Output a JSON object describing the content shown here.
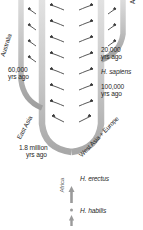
{
  "diagram": {
    "type": "evolution-migration-tree",
    "colors": {
      "trunk_dark": "#9a9a9a",
      "branch_light": "#d9d9d9",
      "branch_mid": "#b5b5b5",
      "arrow": "#3a3a3a",
      "text": "#1f1f1f",
      "background": "#ffffff"
    },
    "regions": {
      "america": "America",
      "australia": "Australia",
      "east_asia": "East Asia",
      "west_asia_europe": "West Asia + Europe",
      "africa": "Africa"
    },
    "time_labels": {
      "twenty_k_line1": "20,000",
      "twenty_k_line2": "yrs ago",
      "hundred_k_line1": "100,000",
      "hundred_k_line2": "yrs ago",
      "sixty_k_line1": "60,000",
      "sixty_k_line2": "yrs ago",
      "one_point_eight_m_line1": "1.8 million",
      "one_point_eight_m_line2": "yrs ago"
    },
    "species": {
      "sapiens": "H. sapiens",
      "erectus": "H. erectus",
      "habilis": "H. habilis"
    }
  }
}
